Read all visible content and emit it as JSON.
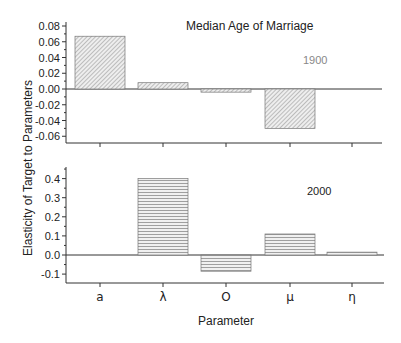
{
  "chart_data": [
    {
      "type": "bar",
      "panel": "top",
      "title": "Median Age of Marriage",
      "annotation": "1900",
      "categories": [
        "a",
        "λ",
        "O",
        "μ",
        "η"
      ],
      "values": [
        0.067,
        0.008,
        -0.004,
        -0.05,
        0.0
      ],
      "ylabel": "Elasticity of Target to Parameters",
      "xlabel": "Parameter",
      "ylim": [
        -0.07,
        0.08
      ],
      "yticks": [
        "0.08",
        "0.06",
        "0.04",
        "0.02",
        "0.00",
        "-0.02",
        "-0.04",
        "-0.06"
      ],
      "ytick_values": [
        0.08,
        0.06,
        0.04,
        0.02,
        0.0,
        -0.02,
        -0.04,
        -0.06
      ],
      "fill_pattern": "diagonal-hatch",
      "grid": false
    },
    {
      "type": "bar",
      "panel": "bottom",
      "annotation": "2000",
      "categories": [
        "a",
        "λ",
        "O",
        "μ",
        "η"
      ],
      "values": [
        0.0,
        0.4,
        -0.085,
        0.11,
        0.015
      ],
      "ylabel": "Elasticity of Target to Parameters",
      "xlabel": "Parameter",
      "ylim": [
        -0.15,
        0.45
      ],
      "yticks": [
        "0.4",
        "0.3",
        "0.2",
        "0.1",
        "0.0",
        "-0.1"
      ],
      "ytick_values": [
        0.4,
        0.3,
        0.2,
        0.1,
        0.0,
        -0.1
      ],
      "fill_pattern": "horizontal-lines",
      "grid": false
    }
  ],
  "labels": {
    "title": "Median Age of Marriage",
    "top_year": "1900",
    "bottom_year": "2000",
    "ylabel": "Elasticity of Target to Parameters",
    "xlabel": "Parameter",
    "categories": [
      "a",
      "λ",
      "O",
      "μ",
      "η"
    ],
    "top_yticks": [
      "0.08",
      "0.06",
      "0.04",
      "0.02",
      "0.00",
      "-0.02",
      "-0.04",
      "-0.06"
    ],
    "bottom_yticks": [
      "0.4",
      "0.3",
      "0.2",
      "0.1",
      "0.0",
      "-0.1"
    ]
  },
  "colors": {
    "axis": "#333333",
    "bar_fill": "#e8e8e8",
    "hatch": "#8a8a8a",
    "year_1900": "#888888",
    "year_2000": "#222222"
  }
}
